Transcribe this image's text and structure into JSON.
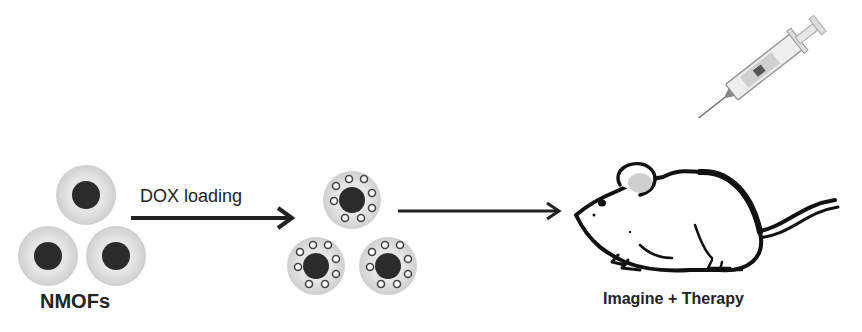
{
  "diagram": {
    "type": "process-flow",
    "steps": [
      {
        "id": "nmofs",
        "label": "NMOFs"
      },
      {
        "id": "dox_loaded",
        "label": ""
      },
      {
        "id": "mouse",
        "label": "Imagine + Therapy"
      }
    ],
    "arrows": [
      {
        "from": "nmofs",
        "to": "dox_loaded",
        "label": "DOX loading"
      },
      {
        "from": "dox_loaded",
        "to": "mouse",
        "label": ""
      }
    ]
  },
  "labels": {
    "nmofs": "NMOFs",
    "dox_loading": "DOX loading",
    "imaging_therapy": "Imagine + Therapy"
  },
  "colors": {
    "core": "#2b2b2b",
    "shell": "#d8d8d8",
    "line": "#222222"
  }
}
